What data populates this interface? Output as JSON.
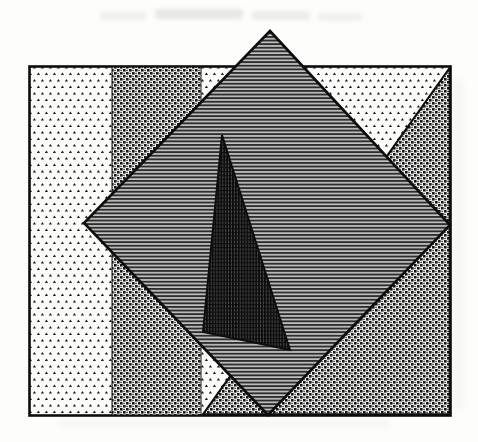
{
  "figure": {
    "canvas": {
      "width": 478,
      "height": 442,
      "background": "#fdfdfc"
    },
    "palette": {
      "ink": "#0d0d0d",
      "paper": "#fbfbf9",
      "stripe_dark": "#2d2d2d",
      "stripe_light": "#c2c2c0",
      "shadow_base": "#4e4e4e",
      "shadow_line": "#0d0d0d",
      "glyph_dark": "#1c1c1c",
      "smudge_gray": "#9a9a9a"
    },
    "patterns": {
      "dots": {
        "label": "staggered-triangle-dots",
        "tile_w": 8,
        "tile_h": 13
      },
      "weave": {
        "label": "basket-weave",
        "tile_w": 6,
        "tile_h": 6
      },
      "hlines": {
        "label": "horizontal-lines",
        "tile_w": 4,
        "tile_h": 3.6
      },
      "vgrid": {
        "label": "dark-vertical-grid",
        "tile_w": 2.9,
        "tile_h": 3.8
      }
    },
    "shapes": [
      {
        "name": "outer-rectangle",
        "type": "rect",
        "x": 29.5,
        "y": 66.5,
        "w": 421,
        "h": 349,
        "fill": "pattern:dots",
        "stroke": "#0d0d0d",
        "strokeWidth": 2.6
      },
      {
        "name": "weave-strip",
        "type": "rect",
        "x": 112,
        "y": 67,
        "w": 89,
        "h": 348,
        "fill": "pattern:weave",
        "stroke": "#141414",
        "strokeWidth": 1
      },
      {
        "name": "weave-corner-triangle",
        "type": "polygon",
        "points": [
          [
            449.7,
            68
          ],
          [
            449.7,
            414.3
          ],
          [
            203,
            414.3
          ]
        ],
        "fill": "pattern:weave",
        "stroke": "#0d0d0d",
        "strokeWidth": 2
      },
      {
        "name": "lined-diamond",
        "type": "polygon",
        "points": [
          [
            270,
            31
          ],
          [
            450,
            225
          ],
          [
            268,
            415
          ],
          [
            84,
            223
          ]
        ],
        "fill": "pattern:hlines",
        "stroke": "#0d0d0d",
        "strokeWidth": 2.6
      },
      {
        "name": "dark-shadow-triangle",
        "type": "polygon",
        "points": [
          [
            222,
            135
          ],
          [
            203,
            332
          ],
          [
            290,
            350
          ]
        ],
        "fill": "pattern:vgrid",
        "stroke": "#0d0d0d",
        "strokeWidth": 2
      }
    ],
    "artifacts": [
      {
        "name": "scan-bleed-mark",
        "x": 100,
        "y": 12,
        "w": 46,
        "h": 8,
        "opacity": 0.16
      },
      {
        "name": "scan-bleed-mark",
        "x": 155,
        "y": 9,
        "w": 88,
        "h": 10,
        "opacity": 0.22
      },
      {
        "name": "scan-bleed-mark",
        "x": 252,
        "y": 11,
        "w": 58,
        "h": 9,
        "opacity": 0.18
      },
      {
        "name": "scan-bleed-mark",
        "x": 318,
        "y": 13,
        "w": 44,
        "h": 8,
        "opacity": 0.14
      },
      {
        "name": "scan-edge-shade",
        "x": 453,
        "y": 80,
        "w": 11,
        "h": 330,
        "opacity": 0.07
      },
      {
        "name": "scan-edge-shade",
        "x": 60,
        "y": 419,
        "w": 330,
        "h": 9,
        "opacity": 0.06
      }
    ]
  }
}
